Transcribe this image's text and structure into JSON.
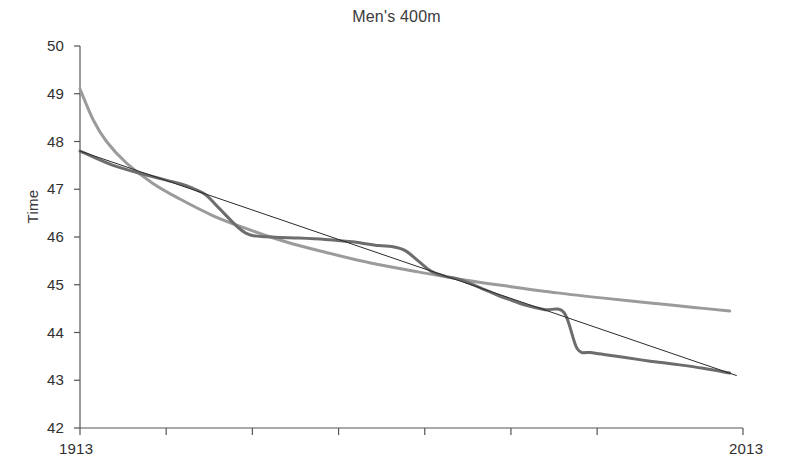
{
  "chart_data": {
    "type": "line",
    "title": "Men's 400m",
    "xlabel": "",
    "ylabel": "Time",
    "xlim": [
      1913,
      2013
    ],
    "ylim": [
      42,
      50
    ],
    "grid": false,
    "legend": "none",
    "x_tick_labels": [
      "1913",
      "2013"
    ],
    "x_ticks": [
      1913,
      1926,
      1939,
      1952,
      1965,
      1978,
      1991,
      2013
    ],
    "y_tick_labels": [
      "50",
      "49",
      "48",
      "47",
      "46",
      "45",
      "44",
      "43",
      "42"
    ],
    "y_ticks": [
      50,
      49,
      48,
      47,
      46,
      45,
      44,
      43,
      42
    ],
    "series": [
      {
        "name": "exponential-fit",
        "color": "#9b9b9b",
        "width": 3,
        "x": [
          1913,
          1915,
          1917,
          1920,
          1924,
          1928,
          1933,
          1938,
          1944,
          1950,
          1957,
          1964,
          1971,
          1978,
          1985,
          1992,
          1999,
          2006,
          2011
        ],
        "values": [
          49.1,
          48.45,
          48.0,
          47.55,
          47.12,
          46.8,
          46.45,
          46.18,
          45.9,
          45.68,
          45.45,
          45.27,
          45.1,
          44.96,
          44.83,
          44.72,
          44.62,
          44.52,
          44.45
        ]
      },
      {
        "name": "observed-record-progression",
        "color": "#6d6d6d",
        "width": 3,
        "x": [
          1913,
          1918,
          1923,
          1928,
          1930,
          1932,
          1934,
          1938,
          1942,
          1946,
          1950,
          1954,
          1958,
          1960,
          1962,
          1964,
          1966,
          1968,
          1970,
          1972,
          1974,
          1976,
          1978,
          1980,
          1983,
          1986,
          1988,
          1990,
          1992,
          1995,
          1999,
          2003,
          2007,
          2011
        ],
        "values": [
          47.8,
          47.5,
          47.3,
          47.12,
          47.02,
          46.88,
          46.6,
          46.08,
          46.0,
          45.98,
          45.95,
          45.9,
          45.82,
          45.8,
          45.72,
          45.5,
          45.28,
          45.18,
          45.12,
          45.02,
          44.9,
          44.78,
          44.68,
          44.58,
          44.48,
          44.42,
          43.66,
          43.58,
          43.54,
          43.48,
          43.4,
          43.33,
          43.25,
          43.15
        ]
      },
      {
        "name": "linear-fit",
        "color": "#2b2b2b",
        "width": 1,
        "x": [
          1913,
          2012
        ],
        "values": [
          47.8,
          43.1
        ]
      }
    ]
  },
  "axes": {
    "axis_color": "#555555",
    "tick_color": "#555555"
  }
}
